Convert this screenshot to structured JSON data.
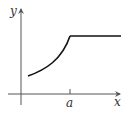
{
  "diagram": {
    "type": "function-graph",
    "axes": {
      "x_label": "x",
      "y_label": "y"
    },
    "tick": {
      "label": "a",
      "position": "x-axis"
    },
    "curve": {
      "description": "increasing concave-up curve from near the y-axis to x = a, then constant horizontal line for x > a",
      "segments": [
        {
          "kind": "increasing-curve",
          "from": "near 0",
          "to": "a"
        },
        {
          "kind": "horizontal-line",
          "from": "a",
          "to": "beyond"
        }
      ]
    },
    "colors": {
      "axis": "#555555",
      "curve": "#111111",
      "text": "#333333"
    }
  }
}
